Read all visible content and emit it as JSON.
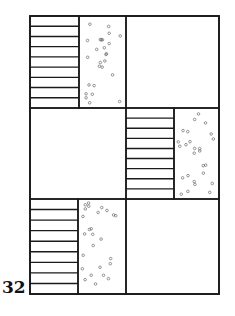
{
  "figure": {
    "number_label": "32",
    "colors": {
      "stroke": "#1a1a1a",
      "background": "#ffffff",
      "dots": "#555555"
    },
    "frame": {
      "x": 30,
      "y": 16,
      "w": 189,
      "h": 278
    },
    "rows": [
      {
        "y0": 16,
        "y1": 108,
        "hatched": {
          "x0": 30,
          "x1": 79
        },
        "dotted": {
          "x0": 79,
          "x1": 126
        },
        "blank": {
          "x0": 126,
          "x1": 219
        }
      },
      {
        "y0": 108,
        "y1": 199,
        "blank": {
          "x0": 30,
          "x1": 126
        },
        "hatched": {
          "x0": 126,
          "x1": 174
        },
        "dotted": {
          "x0": 174,
          "x1": 219
        }
      },
      {
        "y0": 199,
        "y1": 294,
        "hatched": {
          "x0": 30,
          "x1": 78
        },
        "dotted": {
          "x0": 78,
          "x1": 126
        },
        "blank": {
          "x0": 126,
          "x1": 219
        }
      }
    ],
    "hatch_lines_per_block": 8
  }
}
